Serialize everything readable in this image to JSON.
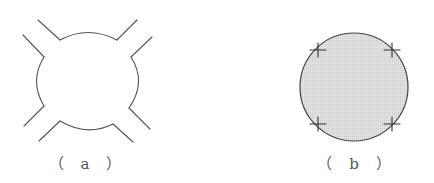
{
  "figures": [
    {
      "id": "a",
      "label": "（ a ）",
      "description": "Circle with four notched openings; a pair of diagonal lead lines extends outward at each of the four 45° quadrants",
      "stroke_color": "#555555"
    },
    {
      "id": "b",
      "label": "（ b ）",
      "description": "Shaded filled circle with four cross (+) markers on its circumference at the 45° positions",
      "fill_color": "#dcdcdc",
      "stroke_color": "#444444",
      "marker": "cross"
    }
  ]
}
